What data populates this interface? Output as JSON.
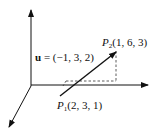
{
  "diagram": {
    "type": "3d-vector",
    "vector_label": {
      "name": "u",
      "eq": " = (−1, 3, 2)"
    },
    "p2": {
      "name": "P",
      "sub": "2",
      "coords": "(1, 6, 3)"
    },
    "p1": {
      "name": "P",
      "sub": "1",
      "coords": "(2, 3, 1)"
    },
    "colors": {
      "stroke": "#111111",
      "dashed": "#333333"
    }
  }
}
